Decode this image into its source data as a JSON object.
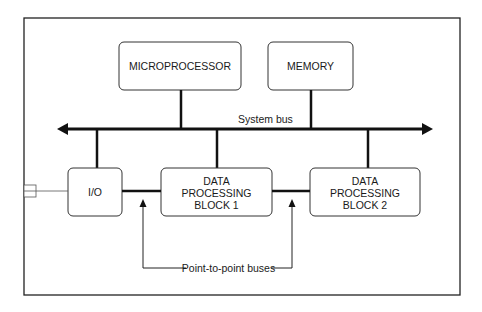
{
  "diagram": {
    "blocks": {
      "microprocessor": "MICROPROCESSOR",
      "memory": "MEMORY",
      "io": "I/O",
      "dpb1": [
        "DATA",
        "PROCESSING",
        "BLOCK 1"
      ],
      "dpb2": [
        "DATA",
        "PROCESSING",
        "BLOCK 2"
      ]
    },
    "labels": {
      "system_bus": "System bus",
      "point_to_point": "Point-to-point buses"
    },
    "colors": {
      "line": "#1a1a1a",
      "box_border": "#333333",
      "background": "#ffffff"
    }
  }
}
